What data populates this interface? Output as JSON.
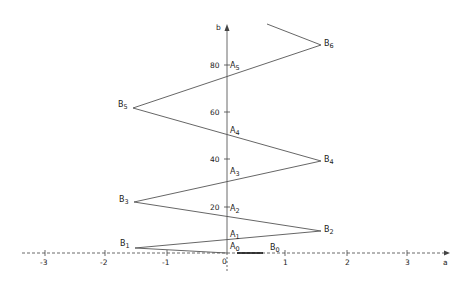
{
  "diagram": {
    "type": "zigzag-construction",
    "axes": {
      "x_label": "a",
      "y_label": "b",
      "x_ticks": [
        "-3",
        "-2",
        "-1",
        "0",
        "1",
        "2",
        "3"
      ],
      "y_ticks": [
        "20",
        "40",
        "60",
        "80"
      ],
      "origin_label": "0"
    },
    "points_B": [
      {
        "name": "B",
        "sub": "0",
        "x": 276,
        "y": 253
      },
      {
        "name": "B",
        "sub": "1",
        "x": 135,
        "y": 248
      },
      {
        "name": "B",
        "sub": "2",
        "x": 321,
        "y": 231
      },
      {
        "name": "B",
        "sub": "3",
        "x": 134,
        "y": 202
      },
      {
        "name": "B",
        "sub": "4",
        "x": 321,
        "y": 161
      },
      {
        "name": "B",
        "sub": "5",
        "x": 133,
        "y": 108
      },
      {
        "name": "B",
        "sub": "6",
        "x": 321,
        "y": 45
      }
    ],
    "points_A": [
      {
        "name": "A",
        "sub": "0"
      },
      {
        "name": "A",
        "sub": "1"
      },
      {
        "name": "A",
        "sub": "2"
      },
      {
        "name": "A",
        "sub": "3"
      },
      {
        "name": "A",
        "sub": "4"
      },
      {
        "name": "A",
        "sub": "5"
      }
    ],
    "colors": {
      "line": "#555555",
      "axis": "#444444",
      "text": "#222222"
    }
  }
}
